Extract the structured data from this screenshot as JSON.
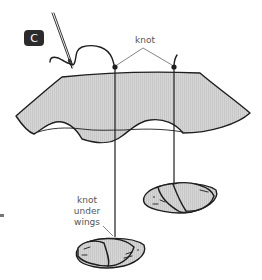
{
  "diagram": {
    "step_label": "C",
    "labels": {
      "knot_top": "knot",
      "knot_under_wings": [
        "knot",
        "under",
        "wings"
      ]
    },
    "colors": {
      "badge": "#2b2b2b",
      "shape_fill": "#d4d4d4",
      "line": "#1e1e1e",
      "label_text": "#555555"
    }
  }
}
